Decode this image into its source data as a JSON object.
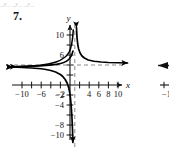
{
  "page": {
    "cutoff_header": "_y_  _y_                                  _y_",
    "problem_number": "7."
  },
  "figure": {
    "x_axis_label": "x",
    "y_axis_label": "y",
    "x_tick_labels": [
      "-10",
      "-6",
      "-2",
      "4",
      "6",
      "8",
      "10"
    ],
    "y_tick_labels": [
      "10",
      "6",
      "-2",
      "-4",
      "-8",
      "-10"
    ],
    "colors": {
      "axis": "#111111",
      "curve": "#000000",
      "asymptote": "#8a8a8a",
      "background": "#ffffff"
    }
  },
  "neighbor_figure": {
    "partial_tick_label": "-1"
  },
  "chart_data": {
    "type": "line",
    "title": "",
    "xlabel": "x",
    "ylabel": "y",
    "xlim": [
      -12,
      12
    ],
    "ylim": [
      -12,
      12
    ],
    "grid": false,
    "legend": "none",
    "x_ticks": [
      -10,
      -8,
      -6,
      -4,
      -2,
      2,
      4,
      6,
      8,
      10
    ],
    "x_tick_labels_shown": [
      -10,
      -6,
      -2,
      4,
      6,
      8,
      10
    ],
    "y_ticks": [
      -10,
      -8,
      -6,
      -4,
      -2,
      2,
      4,
      6,
      8,
      10
    ],
    "y_tick_labels_shown": [
      10,
      6,
      -2,
      -4,
      -8,
      -10
    ],
    "asymptotes": {
      "vertical_x": 1,
      "horizontal_y": 4
    },
    "series": [
      {
        "name": "left-branch",
        "comment": "branch for x < 1, approaches y=4 from below going left, dives to -infinity near x=1",
        "points": [
          [
            -12.0,
            3.6
          ],
          [
            -10.0,
            3.5
          ],
          [
            -8.0,
            3.4
          ],
          [
            -6.0,
            3.25
          ],
          [
            -5.0,
            3.1
          ],
          [
            -4.0,
            2.9
          ],
          [
            -3.0,
            2.6
          ],
          [
            -2.0,
            2.1
          ],
          [
            -1.5,
            1.7
          ],
          [
            -1.0,
            1.1
          ],
          [
            -0.6,
            0.4
          ],
          [
            -0.3,
            -0.4
          ],
          [
            -0.1,
            -1.3
          ],
          [
            0.1,
            -2.6
          ],
          [
            0.25,
            -4.2
          ],
          [
            0.4,
            -6.4
          ],
          [
            0.52,
            -9.0
          ],
          [
            0.6,
            -11.5
          ]
        ]
      },
      {
        "name": "right-branch",
        "comment": "branch for x > 1, rises to +infinity near x=1, approaches y=4 from above going right",
        "points": [
          [
            1.35,
            11.5
          ],
          [
            1.45,
            9.6
          ],
          [
            1.6,
            8.2
          ],
          [
            1.8,
            7.2
          ],
          [
            2.1,
            6.4
          ],
          [
            2.5,
            5.8
          ],
          [
            3.0,
            5.4
          ],
          [
            3.8,
            5.0
          ],
          [
            5.0,
            4.75
          ],
          [
            6.5,
            4.6
          ],
          [
            8.0,
            4.5
          ],
          [
            10.0,
            4.45
          ],
          [
            12.0,
            4.4
          ]
        ]
      }
    ],
    "arrow_endpoints": [
      {
        "at": [
          -12,
          3.6
        ],
        "direction": "left"
      },
      {
        "at": [
          0.62,
          -11.8
        ],
        "direction": "down"
      },
      {
        "at": [
          1.3,
          11.8
        ],
        "direction": "up"
      },
      {
        "at": [
          12,
          4.4
        ],
        "direction": "right"
      }
    ]
  }
}
